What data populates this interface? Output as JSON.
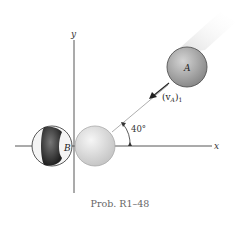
{
  "figure": {
    "caption": "Prob. R1–48",
    "axes": {
      "x_label": "x",
      "y_label": "y"
    },
    "balls": [
      {
        "id": "A",
        "label": "A"
      },
      {
        "id": "B",
        "label": "B"
      }
    ],
    "velocity_label_main": "(v",
    "velocity_label_sub": "A",
    "velocity_label_close": ")",
    "velocity_label_subscript": "1",
    "angle_label": "40°",
    "colors": {
      "axis": "#444444",
      "ball_a": "#a8a8a8",
      "ball_b_dark": "#3a3a3a",
      "ghost_ball": "#d8d8d8",
      "caption": "#666666"
    }
  }
}
